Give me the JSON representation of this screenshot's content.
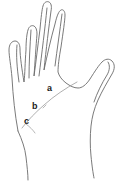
{
  "figure": {
    "type": "line-drawing",
    "background_color": "#ffffff",
    "stroke_color": "#6b6b6b",
    "label_color": "#1a1a1a",
    "canvas": {
      "width": 127,
      "height": 183
    }
  },
  "labels": [
    {
      "id": "a",
      "text": "a",
      "x": 47,
      "y": 84
    },
    {
      "id": "b",
      "text": "b",
      "x": 32,
      "y": 102
    },
    {
      "id": "c",
      "text": "c",
      "x": 24,
      "y": 117
    }
  ],
  "parts": {
    "pinky_finger": "pinky-finger",
    "ring_finger": "ring-finger",
    "middle_finger": "middle-finger",
    "index_finger": "index-finger",
    "thumb": "thumb",
    "palm": "palm",
    "wrist": "wrist",
    "palm_crease": "palm-crease"
  }
}
